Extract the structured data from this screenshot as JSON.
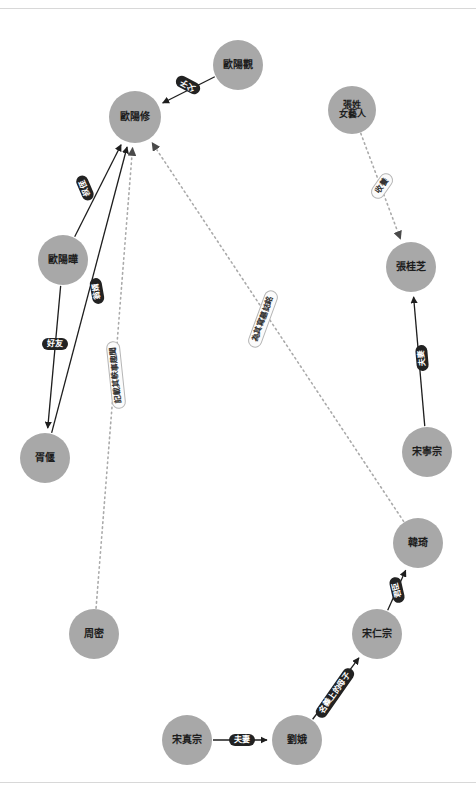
{
  "diagram": {
    "type": "knowledge-graph",
    "background_color": "#ffffff",
    "node_color": "#a8a8a8",
    "node_text_color": "#1d1d1d",
    "edge_solid_color": "#1e1e1e",
    "edge_dotted_color": "#aaaaaa",
    "label_dark_bg": "#222222",
    "label_dark_text": "#ffffff",
    "label_light_bg": "#fbfbfb",
    "label_light_text": "#333333"
  },
  "nodes": [
    {
      "id": "ouyangguan",
      "label": "歐陽觀",
      "x": 238,
      "y": 65,
      "r": 25,
      "font": 10
    },
    {
      "id": "ouyangxiu",
      "label": "歐陽修",
      "x": 135,
      "y": 117,
      "r": 26,
      "font": 10
    },
    {
      "id": "zhangartist",
      "label": "張姓\n女藝人",
      "x": 352,
      "y": 110,
      "r": 24,
      "font": 9
    },
    {
      "id": "ouyangye",
      "label": "歐陽曄",
      "x": 63,
      "y": 260,
      "r": 25,
      "font": 10
    },
    {
      "id": "zhangguizhi",
      "label": "張桂芝",
      "x": 411,
      "y": 267,
      "r": 25,
      "font": 10
    },
    {
      "id": "xuyan",
      "label": "胥偃",
      "x": 45,
      "y": 458,
      "r": 25,
      "font": 10
    },
    {
      "id": "songningzong",
      "label": "宋寧宗",
      "x": 427,
      "y": 452,
      "r": 25,
      "font": 10
    },
    {
      "id": "hanqi",
      "label": "韓琦",
      "x": 418,
      "y": 543,
      "r": 25,
      "font": 10
    },
    {
      "id": "zhoumi",
      "label": "周密",
      "x": 94,
      "y": 634,
      "r": 25,
      "font": 10
    },
    {
      "id": "songrenzong",
      "label": "宋仁宗",
      "x": 377,
      "y": 634,
      "r": 25,
      "font": 10
    },
    {
      "id": "songzhenzong",
      "label": "宋真宗",
      "x": 187,
      "y": 740,
      "r": 25,
      "font": 10
    },
    {
      "id": "liue",
      "label": "劉娥",
      "x": 297,
      "y": 740,
      "r": 25,
      "font": 10
    }
  ],
  "edges": [
    {
      "id": "e1",
      "from": "ouyangguan",
      "to": "ouyangxiu",
      "label": "父子",
      "style": "solid",
      "arrow": true,
      "label_x": 188,
      "label_y": 85,
      "rotate": -152,
      "label_style": "dark"
    },
    {
      "id": "e2",
      "from": "ouyangye",
      "to": "ouyangxiu",
      "label": "叔侄",
      "style": "solid",
      "arrow": true,
      "label_x": 85,
      "label_y": 188,
      "rotate": -113,
      "label_style": "dark"
    },
    {
      "id": "e3",
      "from": "xuyan",
      "to": "ouyangxiu",
      "label": "翁婿",
      "style": "solid",
      "arrow": true,
      "label_x": 97,
      "label_y": 291,
      "rotate": -100,
      "label_style": "dark"
    },
    {
      "id": "e4",
      "from": "ouyangye",
      "to": "xuyan",
      "label": "好友",
      "style": "solid",
      "arrow": true,
      "label_x": 55,
      "label_y": 344,
      "rotate": 0,
      "label_style": "dark"
    },
    {
      "id": "e5",
      "from": "zhoumi",
      "to": "ouyangxiu",
      "label": "記載其軼事趣聞",
      "style": "dotted",
      "arrow": true,
      "label_x": 116,
      "label_y": 375,
      "rotate": -96,
      "label_style": "light"
    },
    {
      "id": "e6",
      "from": "hanqi",
      "to": "ouyangxiu",
      "label": "為其寫墓誌銘",
      "style": "dotted",
      "arrow": true,
      "label_x": 263,
      "label_y": 319,
      "rotate": -70,
      "label_style": "light"
    },
    {
      "id": "e7",
      "from": "zhangartist",
      "to": "zhangguizhi",
      "label": "收養",
      "style": "dotted",
      "arrow": true,
      "label_x": 382,
      "label_y": 186,
      "rotate": -55,
      "label_style": "light"
    },
    {
      "id": "e8",
      "from": "songningzong",
      "to": "zhangguizhi",
      "label": "夫妻",
      "style": "solid",
      "arrow": true,
      "label_x": 422,
      "label_y": 358,
      "rotate": -95,
      "label_style": "dark"
    },
    {
      "id": "e9",
      "from": "songrenzong",
      "to": "hanqi",
      "label": "君臣",
      "style": "solid",
      "arrow": true,
      "label_x": 397,
      "label_y": 590,
      "rotate": -103,
      "label_style": "dark"
    },
    {
      "id": "e10",
      "from": "liue",
      "to": "songrenzong",
      "label": "名義上的母子",
      "style": "solid",
      "arrow": true,
      "label_x": 335,
      "label_y": 693,
      "rotate": -55,
      "label_style": "dark"
    },
    {
      "id": "e11",
      "from": "songzhenzong",
      "to": "liue",
      "label": "夫妻",
      "style": "solid",
      "arrow": true,
      "label_x": 242,
      "label_y": 740,
      "rotate": 0,
      "label_style": "dark"
    }
  ]
}
